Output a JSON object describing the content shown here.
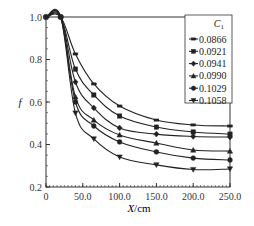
{
  "chart_data": {
    "type": "line",
    "title": "",
    "xlabel": "X/cm",
    "xlabel_italic_part": "X",
    "xlabel_unit": "/cm",
    "ylabel": "f",
    "xlim": [
      0,
      250
    ],
    "ylim": [
      0.2,
      1.0
    ],
    "xticks": [
      0,
      50,
      100,
      150,
      200,
      250
    ],
    "xtick_labels": [
      "0",
      "50.0",
      "100.0",
      "150.0",
      "200.0",
      "250.0"
    ],
    "yticks": [
      0.2,
      0.4,
      0.6,
      0.8,
      1.0
    ],
    "ytick_labels": [
      "0.2",
      "0.4",
      "0.6",
      "0.8",
      "1.0"
    ],
    "grid": false,
    "legend_position": "upper right",
    "legend_title": "C",
    "legend_title_sub": "1",
    "x": [
      0,
      20,
      40,
      65,
      100,
      150,
      200,
      250
    ],
    "series": [
      {
        "name": "0.0866",
        "marker": "dash",
        "values": [
          1.0,
          1.0,
          0.826,
          0.685,
          0.581,
          0.515,
          0.492,
          0.487
        ]
      },
      {
        "name": "0.0921",
        "marker": "square",
        "values": [
          1.0,
          1.0,
          0.755,
          0.633,
          0.534,
          0.482,
          0.459,
          0.449
        ]
      },
      {
        "name": "0.0941",
        "marker": "diamond",
        "values": [
          1.0,
          1.0,
          0.694,
          0.572,
          0.478,
          0.449,
          0.438,
          0.435
        ]
      },
      {
        "name": "0.0990",
        "marker": "triangle-up",
        "values": [
          1.0,
          1.0,
          0.624,
          0.515,
          0.445,
          0.407,
          0.374,
          0.369
        ]
      },
      {
        "name": "0.1029",
        "marker": "circle",
        "values": [
          1.0,
          1.0,
          0.6,
          0.487,
          0.412,
          0.365,
          0.336,
          0.327
        ]
      },
      {
        "name": "0.1058",
        "marker": "triangle-down",
        "values": [
          1.0,
          1.0,
          0.548,
          0.426,
          0.341,
          0.304,
          0.282,
          0.285
        ]
      }
    ]
  },
  "colors": {
    "line": "#222222",
    "axis": "#333333",
    "background": "#ffffff"
  }
}
